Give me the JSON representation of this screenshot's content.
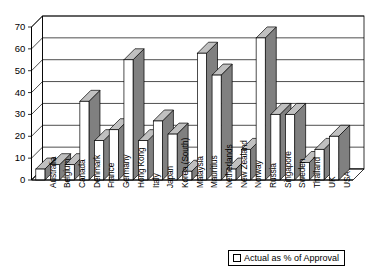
{
  "chart_data": {
    "type": "bar",
    "title": "",
    "subtitle": "",
    "xlabel": "",
    "ylabel": "",
    "ylim": [
      0,
      70
    ],
    "ytick_step": 10,
    "yticks": [
      0,
      10,
      20,
      30,
      40,
      50,
      60,
      70
    ],
    "grid": true,
    "legend_position": "bottom-right",
    "style": "3d-column",
    "categories": [
      "Australia",
      "Belgium",
      "Canada",
      "Denmark",
      "France",
      "Germany",
      "Hong Kong",
      "Italy",
      "Japan",
      "Korea (South)",
      "Malaysia",
      "Mauritius",
      "Netherlands",
      "New Zealand",
      "Norway",
      "Russia",
      "Singapore",
      "Sweden",
      "Thailand",
      "UK",
      "USA"
    ],
    "series": [
      {
        "name": "Actual as % of Approval",
        "values": [
          5,
          7,
          7,
          36,
          18,
          23,
          55,
          18,
          27,
          21,
          4,
          58,
          48,
          5,
          14,
          65,
          30,
          30,
          8,
          14,
          20
        ]
      }
    ]
  },
  "legend": {
    "entries": [
      {
        "label": "Actual as % of Approval",
        "swatch_color": "#ffffff",
        "swatch_border": "#000000"
      }
    ]
  },
  "axis": {
    "y_tick_labels": [
      "70",
      "60",
      "50",
      "40",
      "30",
      "20",
      "10",
      "0"
    ]
  },
  "colors": {
    "bar_face": "#ffffff",
    "bar_side": "#808080",
    "bar_top": "#c0c0c0",
    "outline": "#000000",
    "gridline": "#000000",
    "background": "#ffffff"
  }
}
